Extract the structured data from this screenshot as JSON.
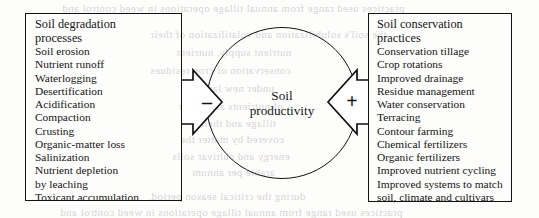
{
  "figure": {
    "left_box": {
      "title": "Soil degradation\nprocesses",
      "items": [
        "Soil erosion",
        "Nutrient runoff",
        "Waterlogging",
        "Desertification",
        "Acidification",
        "Compaction",
        "Crusting",
        "Organic-matter loss",
        "Salinization",
        "Nutrient depletion\n   by leaching",
        "Toxicant accumulation"
      ]
    },
    "right_box": {
      "title": "Soil conservation\npractices",
      "items": [
        "Conservation tillage",
        "Crop rotations",
        "Improved drainage",
        "Residue management",
        "Water conservation",
        "Terracing",
        "Contour farming",
        "Chemical fertilizers",
        "Organic fertilizers",
        "Improved nutrient cycling",
        "Improved systems to match\n    soil, climate and cultivars"
      ]
    },
    "center": {
      "label": "Soil\nproductivity"
    },
    "connectors": {
      "left_sign": "–",
      "left_sign_name": "minus",
      "right_sign": "+",
      "right_sign_name": "plus"
    },
    "colors": {
      "ink": "#111111",
      "paper": "#fdfdfc",
      "bleed": "#b9b7b4"
    }
  },
  "bleed_through": [
    {
      "text": "practices used range from annual tillage operations in weed control and",
      "x": 62,
      "y": 2,
      "size": 11
    },
    {
      "text": "the soil's solubilization and volatilization of their",
      "x": 150,
      "y": 28,
      "size": 11
    },
    {
      "text": "nutrient supply, nutrient",
      "x": 176,
      "y": 46,
      "size": 11
    },
    {
      "text": "conservation of crop residues",
      "x": 150,
      "y": 64,
      "size": 11
    },
    {
      "text": "under new lands",
      "x": 196,
      "y": 82,
      "size": 11
    },
    {
      "text": "of nutrients and water",
      "x": 178,
      "y": 100,
      "size": 11
    },
    {
      "text": "tillage and their",
      "x": 200,
      "y": 117,
      "size": 11
    },
    {
      "text": "covered by matter the",
      "x": 180,
      "y": 133,
      "size": 11
    },
    {
      "text": "energy and cultivar soils",
      "x": 172,
      "y": 150,
      "size": 11
    },
    {
      "text": "arable per annum",
      "x": 192,
      "y": 166,
      "size": 11
    },
    {
      "text": "during the critical season period.",
      "x": 148,
      "y": 190,
      "size": 11
    },
    {
      "text": "practices used range from annual tillage operations in weed control and",
      "x": 60,
      "y": 206,
      "size": 11
    }
  ]
}
